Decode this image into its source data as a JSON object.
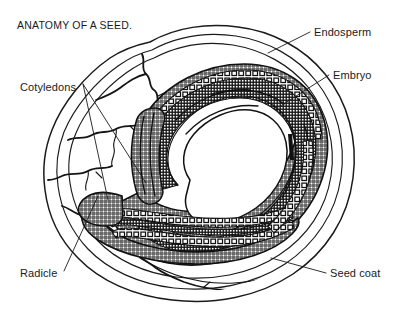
{
  "figure": {
    "title": "ANATOMY OF A SEED.",
    "background_color": "#ffffff",
    "ink_color": "#1a1a1a",
    "width": 394,
    "height": 313,
    "style": "black-and-white botanical line engraving, cross-hatched"
  },
  "labels": {
    "endosperm": {
      "text": "Endosperm",
      "x": 314,
      "y": 36,
      "anchor": "start",
      "leader_from": [
        310,
        32
      ],
      "leader_to": [
        268,
        53
      ]
    },
    "embryo": {
      "text": "Embryo",
      "x": 333,
      "y": 79,
      "anchor": "start",
      "leader_from": [
        329,
        75
      ],
      "leader_to": [
        279,
        107
      ]
    },
    "seed_coat": {
      "text": "Seed coat",
      "x": 330,
      "y": 277,
      "anchor": "start",
      "leader_from": [
        326,
        273
      ],
      "leader_to": [
        271,
        258
      ]
    },
    "cotyledons": {
      "text": "Cotyledons",
      "x": 20,
      "y": 91,
      "anchor": "start",
      "leader_a_from": [
        83,
        84
      ],
      "leader_a_to": [
        146,
        183
      ],
      "leader_b_from": [
        83,
        84
      ],
      "leader_b_to": [
        108,
        200
      ]
    },
    "radicle": {
      "text": "Radicle",
      "x": 20,
      "y": 277,
      "anchor": "start",
      "leader_from": [
        64,
        271
      ],
      "leader_to": [
        98,
        196
      ]
    }
  },
  "structures": [
    {
      "name": "seed-coat",
      "description": "Three concentric outer contour lines forming the testa of the seed"
    },
    {
      "name": "endosperm",
      "description": "Pale cracked nutritive tissue filling the left and outer region of the seed"
    },
    {
      "name": "embryo",
      "description": "Horseshoe shaped cross-hatched body curving around a central cavity"
    },
    {
      "name": "cotyledons",
      "description": "Paired banded seed leaves forming the long curved arms of the embryo"
    },
    {
      "name": "radicle",
      "description": "Embryonic root at the lower left tip of the embryo"
    }
  ]
}
